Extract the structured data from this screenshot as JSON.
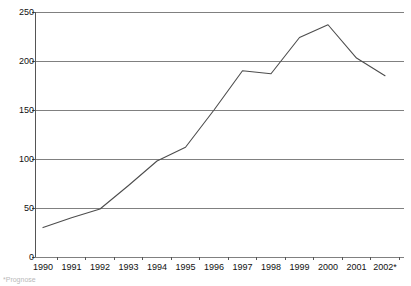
{
  "chart_data": {
    "type": "line",
    "title": "",
    "subtitle": "",
    "xlabel": "",
    "ylabel": "",
    "categories": [
      "1990",
      "1991",
      "1992",
      "1993",
      "1994",
      "1995",
      "1996",
      "1997",
      "1998",
      "1999",
      "2000",
      "2001",
      "2002*"
    ],
    "values": [
      30,
      40,
      49,
      73,
      98,
      112,
      150,
      190,
      187,
      224,
      237,
      203,
      185
    ],
    "series": [
      {
        "name": "",
        "values": [
          30,
          40,
          49,
          73,
          98,
          112,
          150,
          190,
          187,
          224,
          237,
          203,
          185
        ]
      }
    ],
    "ylim": [
      0,
      250
    ],
    "yticks": [
      0,
      50,
      100,
      150,
      200,
      250
    ],
    "ytick_labels": [
      "0",
      "50",
      "100",
      "150",
      "200",
      "250"
    ],
    "xtick_labels": [
      "1990",
      "1991",
      "1992",
      "1993",
      "1994",
      "1995",
      "1996",
      "1997",
      "1998",
      "1999",
      "2000",
      "2001",
      "2002*"
    ],
    "grid": "horizontal",
    "legend": "none",
    "annotations": [
      "*"
    ],
    "line_color": "#4d4d4d",
    "grid_color": "#808080",
    "axis_color": "#555555",
    "background_color": "#ffffff"
  },
  "footnote": {
    "text": "*Prognose"
  }
}
